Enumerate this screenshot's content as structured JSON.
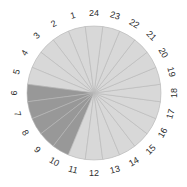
{
  "chart_data": {
    "type": "pie",
    "title": "",
    "subtitle": "",
    "xlabel": "",
    "ylabel": "",
    "categories": [
      "1",
      "2",
      "3",
      "4",
      "5",
      "6",
      "7",
      "8",
      "9",
      "10",
      "11",
      "12",
      "13",
      "14",
      "15",
      "16",
      "17",
      "18",
      "19",
      "20",
      "21",
      "22",
      "23",
      "24"
    ],
    "values": [
      1,
      1,
      1,
      1,
      1,
      1,
      1,
      1,
      1,
      1,
      1,
      1,
      1,
      1,
      1,
      1,
      1,
      1,
      1,
      1,
      1,
      1,
      1,
      1
    ],
    "slice_count": 24,
    "slice_angle_degrees": 15,
    "equal_slices": true,
    "legend": "none",
    "grid": false,
    "labels_position": "outside",
    "label_orientation": "radial",
    "start_angle_degrees": 97.5,
    "direction": "counterclockwise",
    "anchor_notes": {
      "top": "12",
      "right": "18",
      "bottom": "24",
      "left": "6"
    },
    "highlighted_categories": [
      "6",
      "7",
      "8",
      "9",
      "10"
    ],
    "colors": {
      "highlight": "#989898",
      "default": "#d8d8d8",
      "slice_border": "#b9b9b9",
      "label_text": "#2e2e2e",
      "background": "#ffffff"
    },
    "annotations": []
  },
  "figure": {
    "center_x": 94,
    "center_y": 93,
    "radius": 67,
    "label_radius": 80
  }
}
